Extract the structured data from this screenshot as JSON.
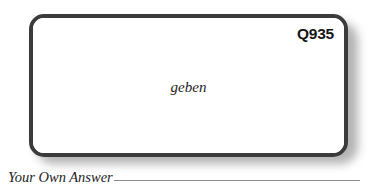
{
  "card": {
    "id_label": "Q935",
    "term": "geben"
  },
  "answer": {
    "label": "Your Own Answer"
  },
  "colors": {
    "page_background": "#ffffff",
    "card_background": "#ffffff",
    "card_border": "#3b3b3b",
    "card_shadow": "#9a9a9a",
    "text": "#1d1d1d",
    "id_text": "#161616",
    "rule": "#8d8d8d"
  }
}
